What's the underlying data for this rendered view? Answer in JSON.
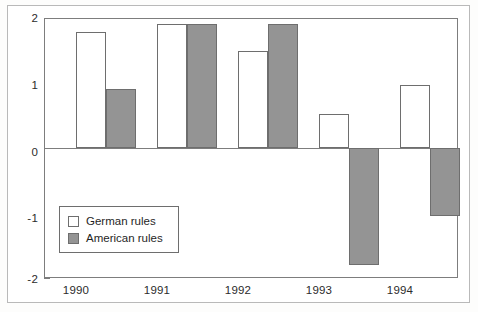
{
  "chart_data": {
    "type": "bar",
    "title": "",
    "subtitle": "",
    "xlabel": "",
    "ylabel": "",
    "categories": [
      "1990",
      "1991",
      "1992",
      "1993",
      "1994"
    ],
    "series": [
      {
        "name": "German rules",
        "color": "#ffffff",
        "values": [
          1.8,
          1.93,
          1.5,
          0.53,
          0.98
        ]
      },
      {
        "name": "American rules",
        "color": "#949494",
        "values": [
          0.92,
          1.93,
          1.93,
          -1.82,
          -1.06
        ]
      }
    ],
    "ylim": [
      -2,
      2
    ],
    "yticks": [
      2,
      1,
      0,
      -1,
      -2
    ],
    "ytick_labels": [
      "2",
      "1",
      "0",
      "-1",
      "-2"
    ],
    "grid": false,
    "legend_position": "inside-lower-left",
    "zero_line": true,
    "annotations": []
  },
  "legend": {
    "entries": [
      {
        "label": "German rules",
        "swatch": "german"
      },
      {
        "label": "American rules",
        "swatch": "american"
      }
    ]
  },
  "axes": {
    "y_labels": [
      "2",
      "1",
      "0",
      "-1",
      "-2"
    ],
    "x_labels": [
      "1990",
      "1991",
      "1992",
      "1993",
      "1994"
    ]
  }
}
